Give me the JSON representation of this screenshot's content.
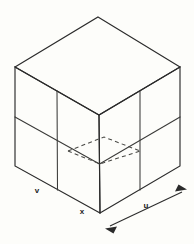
{
  "figure": {
    "background_color": "#fdfdfa",
    "line_color": "#2b2b2b",
    "hidden_line_color": "#4a4a46"
  },
  "labels": {
    "left_axis": "v",
    "bottom_vertex": "x",
    "right_axis": "u"
  },
  "geometry": {
    "top_apex": {
      "x": 98,
      "y": 17
    },
    "left_corner": {
      "x": 15,
      "y": 67
    },
    "right_corner": {
      "x": 180,
      "y": 67
    },
    "front_top_center": {
      "x": 99,
      "y": 115
    },
    "front_bottom_center": {
      "x": 100,
      "y": 213
    },
    "left_bottom": {
      "x": 15,
      "y": 166
    },
    "right_bottom": {
      "x": 180,
      "y": 166
    },
    "hidden_plane": {
      "left": {
        "x": 68,
        "y": 151
      },
      "apex": {
        "x": 104,
        "y": 137
      },
      "right": {
        "x": 140,
        "y": 151
      },
      "bottom": {
        "x": 100,
        "y": 164
      }
    },
    "face_subdivisions": 2
  },
  "dimension_arrow": {
    "label": "u",
    "start": {
      "x": 106,
      "y": 228
    },
    "end": {
      "x": 186,
      "y": 190
    },
    "double_headed": true
  }
}
